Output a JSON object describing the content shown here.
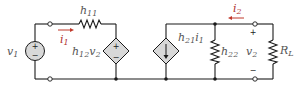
{
  "diagram": {
    "type": "two-port h-parameter equivalent circuit",
    "colors": {
      "wire": "#1a1a1a",
      "source_fill": "#d8d8d8",
      "current_arrow": "#c0392b",
      "label": "#555555"
    },
    "labels": {
      "v1": {
        "main": "v",
        "sub": "1"
      },
      "i1": {
        "main": "i",
        "sub": "1"
      },
      "h11": {
        "main": "h",
        "sub": "11"
      },
      "h12v2": {
        "main": "h",
        "sub": "12",
        "tail": "v",
        "tail_sub": "2"
      },
      "h21i1": {
        "main": "h",
        "sub": "21",
        "tail": "i",
        "tail_sub": "1"
      },
      "h22": {
        "main": "h",
        "sub": "22"
      },
      "i2": {
        "main": "i",
        "sub": "2"
      },
      "v2": {
        "main": "v",
        "sub": "2"
      },
      "RL": {
        "main": "R",
        "sub": "L"
      }
    },
    "signs": {
      "plus": "+",
      "minus": "−"
    },
    "components": [
      "independent voltage source v1",
      "series resistor h11",
      "dependent voltage source h12v2",
      "dependent current source h21i1",
      "shunt resistor h22",
      "load resistor RL"
    ]
  }
}
